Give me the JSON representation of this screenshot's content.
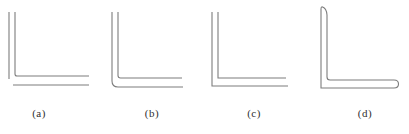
{
  "canvas": {
    "background": "#ffffff",
    "line_color": "#7d7d7d",
    "label_color": "#2f2f2f"
  },
  "figures": [
    {
      "label": "(a)",
      "shape": "open-unjoined-corner-lines"
    },
    {
      "label": "(b)",
      "shape": "rounded-outer-corner"
    },
    {
      "label": "(c)",
      "shape": "sharp-square-corner"
    },
    {
      "label": "(d)",
      "shape": "closed-angle-profile"
    }
  ]
}
